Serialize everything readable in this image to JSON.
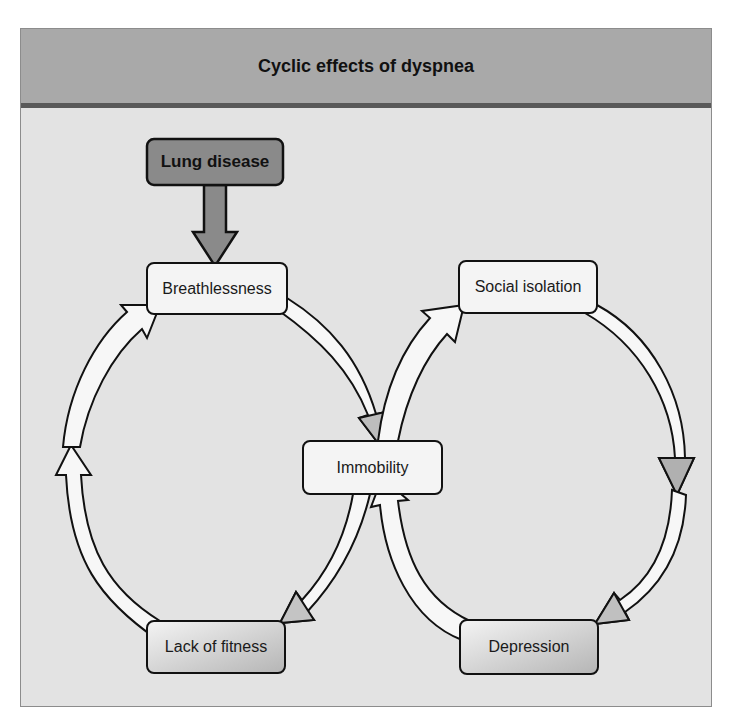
{
  "header": {
    "title": "Cyclic effects of dyspnea"
  },
  "nodes": {
    "lung_disease": "Lung disease",
    "breathlessness": "Breathlessness",
    "social_isolation": "Social isolation",
    "immobility": "Immobility",
    "lack_of_fitness": "Lack of fitness",
    "depression": "Depression"
  },
  "colors": {
    "header_bg": "#a9a9a9",
    "header_rule": "#595959",
    "canvas_bg": "#e3e3e3",
    "cause_box_fill": "#8a8a8a",
    "node_fill": "#f4f4f4",
    "arrow_fill": "#f7f7f7",
    "arrow_head_shaded": "#bdbdbd",
    "outline": "#111111"
  },
  "cycles": [
    {
      "name": "left-loop",
      "sequence": [
        "Breathlessness",
        "Immobility",
        "Lack of fitness",
        "Breathlessness"
      ]
    },
    {
      "name": "right-loop",
      "sequence": [
        "Immobility",
        "Social isolation",
        "Depression",
        "Immobility"
      ]
    }
  ],
  "cause": {
    "from": "Lung disease",
    "to": "Breathlessness"
  }
}
